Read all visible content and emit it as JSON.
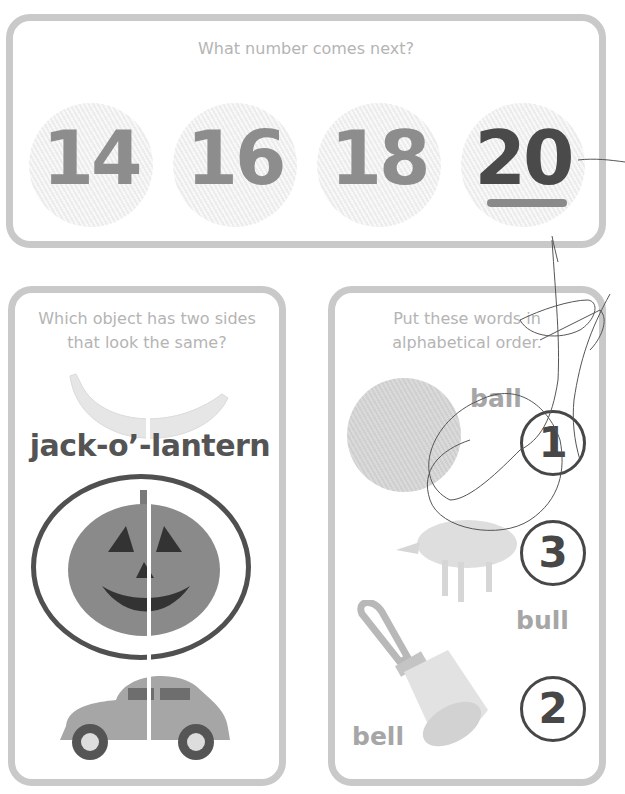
{
  "top_activity": {
    "prompt": "What number comes next?",
    "sequence": [
      "14",
      "16",
      "18"
    ],
    "answer": "20"
  },
  "symmetry_activity": {
    "prompt_line1": "Which object has two sides",
    "prompt_line2": "that look the same?",
    "objects": [
      "banana",
      "jack-o'-lantern",
      "car"
    ],
    "answer_label": "jack-o’-lantern"
  },
  "alphabet_activity": {
    "prompt_line1": "Put these words in",
    "prompt_line2": "alphabetical order.",
    "items": [
      {
        "word": "ball",
        "order": "1"
      },
      {
        "word": "bull",
        "order": "3"
      },
      {
        "word": "bell",
        "order": "2"
      }
    ]
  },
  "colors": {
    "card_border": "#c9c9c9",
    "prompt_text": "#b4b4b4",
    "number_gray": "#8d8d8d",
    "answer_dark": "#4a4a4a"
  }
}
